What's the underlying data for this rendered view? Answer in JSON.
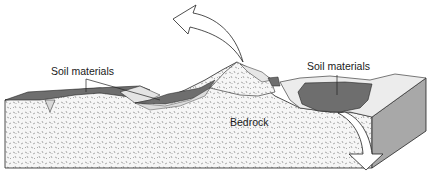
{
  "diagram": {
    "type": "geologic block diagram",
    "labels": {
      "soil_left": "Soil materials",
      "soil_right": "Soil materials",
      "bedrock": "Bedrock"
    },
    "arrows": {
      "upward": "curved arrow up-left from hill crest",
      "downward": "curved arrow down from right basin"
    },
    "colors": {
      "bedrock_fill": "#f4f4f4",
      "soil_dark": "#6e6e6e",
      "soil_light": "#d9d9d9",
      "side_face": "#a8a8a8",
      "outline": "#222222"
    }
  }
}
